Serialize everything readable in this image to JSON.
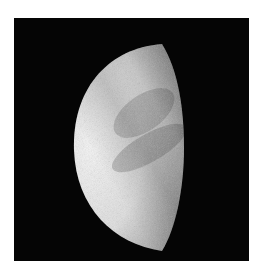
{
  "image": {
    "subject": "planet-crescent-gibbous-phase",
    "background_color": "#050505",
    "page_color": "#ffffff",
    "planet_colors": {
      "bright": "#f4f4f4",
      "mid": "#c8c8c8",
      "dark": "#7a7a7a"
    }
  }
}
